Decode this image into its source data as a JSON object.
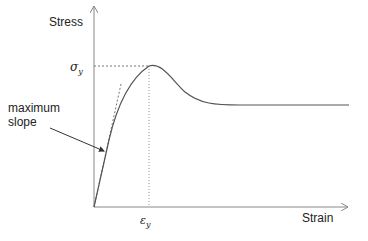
{
  "diagram": {
    "type": "stress-strain curve",
    "y_axis_label": "Stress",
    "x_axis_label": "Strain",
    "yield_stress_symbol": "σ",
    "yield_stress_subscript": "y",
    "yield_strain_symbol": "ε",
    "yield_strain_subscript": "y",
    "annotation_line1": "maximum",
    "annotation_line2": "slope",
    "colors": {
      "axis": "#888888",
      "curve": "#555555",
      "guide": "#777777",
      "text": "#222222"
    }
  }
}
